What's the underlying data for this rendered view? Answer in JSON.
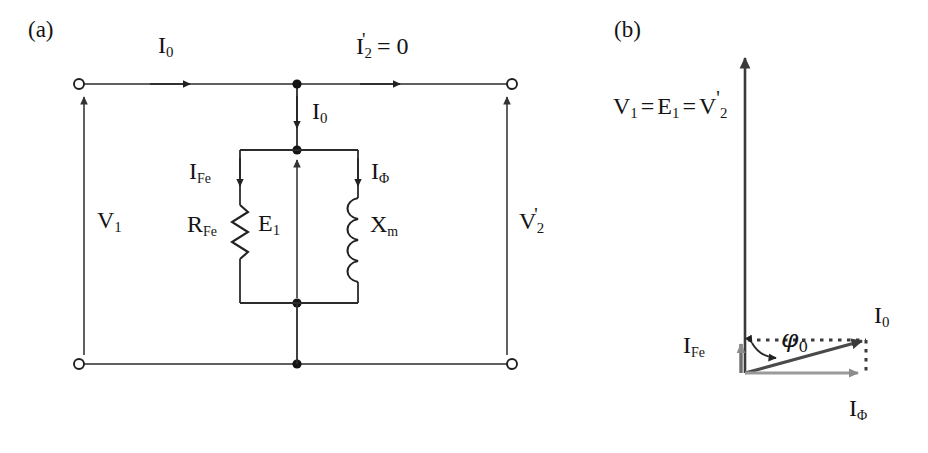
{
  "figure": {
    "panel_a": {
      "tag": "(a)",
      "description": "transformer no-load equivalent circuit",
      "labels": {
        "i0_top": "I",
        "i0_top_sub": "0",
        "i2_prime": "I",
        "i2_prime_sub": "2",
        "i2_prime_prime": "'",
        "i2_prime_eq": "= 0",
        "i0_shunt": "I",
        "i0_shunt_sub": "0",
        "v1": "V",
        "v1_sub": "1",
        "v2": "V",
        "v2_sub": "2",
        "v2_prime": "'",
        "ife": "I",
        "ife_sub": "Fe",
        "iphi": "I",
        "iphi_sub": "Φ",
        "rfe": "R",
        "rfe_sub": "Fe",
        "e1": "E",
        "e1_sub": "1",
        "xm": "X",
        "xm_sub": "m"
      },
      "components": [
        {
          "name": "core-loss-resistor",
          "symbol": "R_Fe",
          "type": "resistor"
        },
        {
          "name": "magnetizing-reactance",
          "symbol": "X_m",
          "type": "inductor"
        }
      ],
      "terminals": [
        {
          "name": "primary-top-terminal"
        },
        {
          "name": "primary-bottom-terminal"
        },
        {
          "name": "secondary-top-terminal"
        },
        {
          "name": "secondary-bottom-terminal"
        }
      ]
    },
    "panel_b": {
      "tag": "(b)",
      "description": "no-load phasor diagram",
      "labels": {
        "voltage_eq": "V₁ = E₁ = V₂'",
        "voltage_v1": "V",
        "voltage_v1_sub": "1",
        "eq1": "=",
        "voltage_e1": "E",
        "voltage_e1_sub": "1",
        "eq2": "=",
        "voltage_v2": "V",
        "voltage_v2_sub": "2",
        "voltage_v2_prime": "'",
        "ife": "I",
        "ife_sub": "Fe",
        "i0": "I",
        "i0_sub": "0",
        "iphi": "I",
        "iphi_sub": "Φ",
        "phi0": "φ",
        "phi0_sub": "0"
      },
      "phasors": [
        {
          "name": "voltage-phasor",
          "label": "V1=E1=V2'",
          "angle_deg": 90,
          "length_px": 321
        },
        {
          "name": "ife-phasor",
          "label": "I_Fe",
          "angle_deg": 90,
          "length_px": 33
        },
        {
          "name": "i0-phasor",
          "label": "I_0",
          "angle_deg": 15.2,
          "length_px": 125
        },
        {
          "name": "iphi-phasor",
          "label": "I_Φ",
          "angle_deg": 0,
          "length_px": 121
        }
      ],
      "angle_annotation": {
        "name": "phi0-angle",
        "symbol": "φ0",
        "value_deg": 15.2
      }
    },
    "colors": {
      "ink": "#1a1a1a",
      "wire": "#2b2b2b",
      "phasor_dark": "#3a3a3a",
      "phasor_gray": "#8c8c8c",
      "background": "#ffffff"
    }
  }
}
